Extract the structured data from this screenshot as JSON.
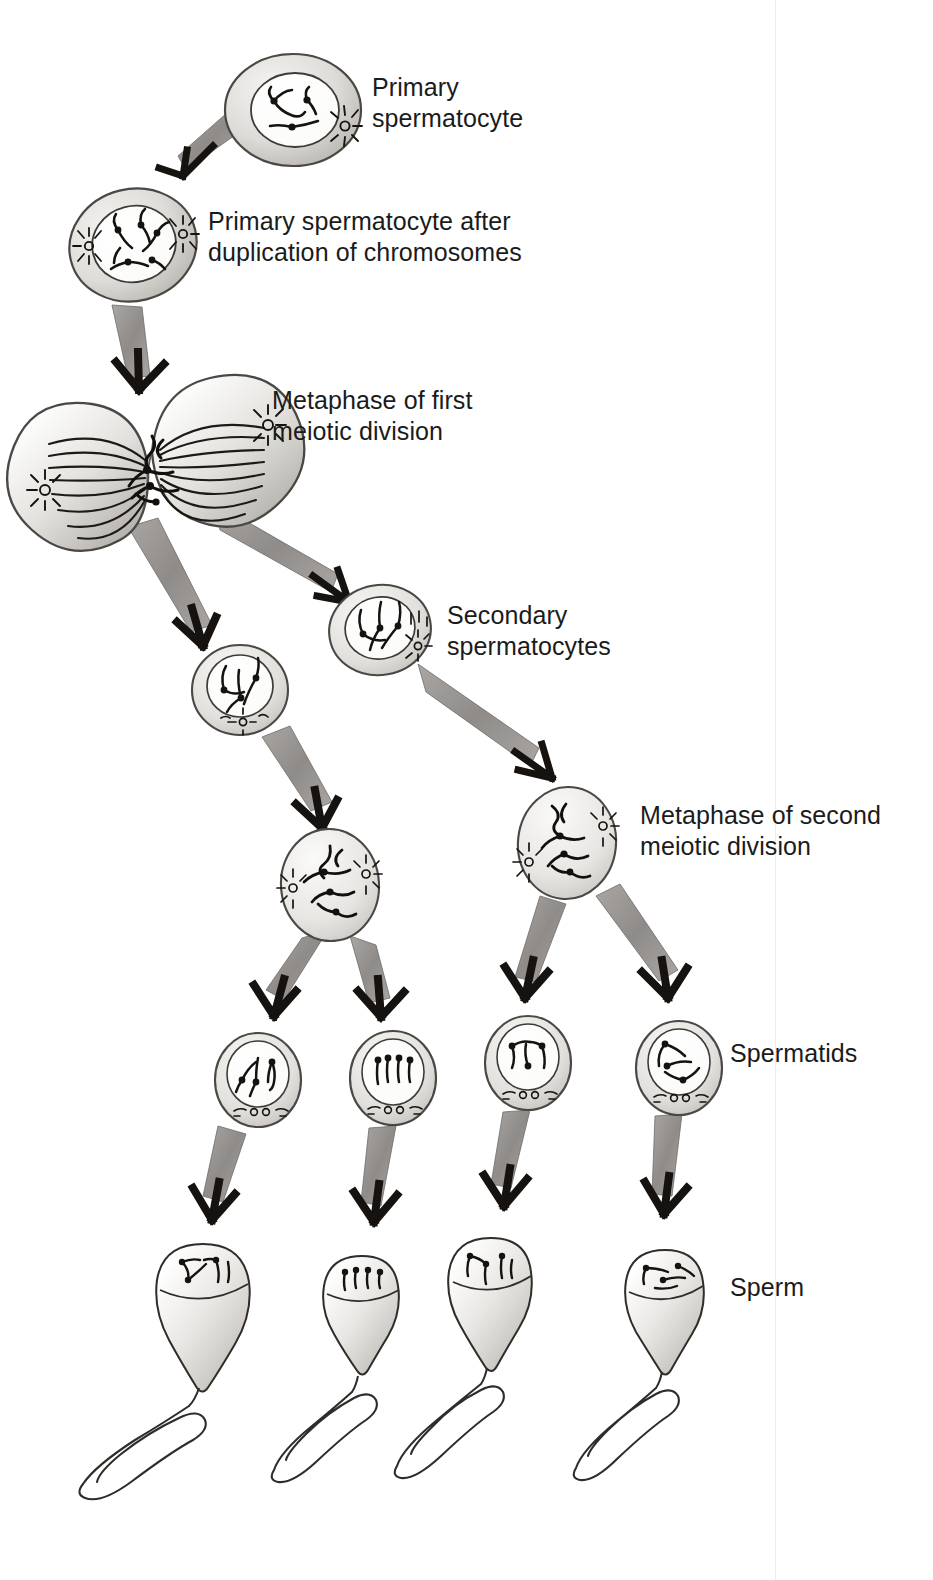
{
  "figure": {
    "background_color": "#ffffff",
    "ink_color": "#1b1b1b",
    "cell_fill_light": "#f2f1ef",
    "cell_fill_mid": "#d9d7d3",
    "cell_fill_dark": "#b3b0ab",
    "arrow_fill": "#9b9896"
  },
  "labels": [
    {
      "id": "primary-spermatocyte",
      "text": "Primary\nspermatocyte",
      "x": 372,
      "y": 72
    },
    {
      "id": "primary-spermatocyte-duplicated",
      "text": "Primary spermatocyte after\nduplication of chromosomes",
      "x": 208,
      "y": 206
    },
    {
      "id": "metaphase-first",
      "text": "Metaphase of first\nmeiotic division",
      "x": 272,
      "y": 385
    },
    {
      "id": "secondary-spermatocytes",
      "text": "Secondary\nspermatocytes",
      "x": 447,
      "y": 600
    },
    {
      "id": "metaphase-second",
      "text": "Metaphase of second\nmeiotic division",
      "x": 640,
      "y": 800
    },
    {
      "id": "spermatids",
      "text": "Spermatids",
      "x": 730,
      "y": 1038
    },
    {
      "id": "sperm",
      "text": "Sperm",
      "x": 730,
      "y": 1272
    }
  ],
  "stages": [
    {
      "id": "stage-primary-spermatocyte",
      "name": "Primary spermatocyte",
      "kind": "interphase-cell",
      "cx": 293,
      "cy": 110,
      "rx": 68,
      "ry": 56,
      "nucleus_rx": 43,
      "nucleus_ry": 36,
      "count": 1
    },
    {
      "id": "stage-primary-spermatocyte-duplicated",
      "name": "Primary spermatocyte after duplication of chromosomes",
      "kind": "interphase-cell",
      "cx": 133,
      "cy": 245,
      "rx": 63,
      "ry": 55,
      "nucleus_rx": 42,
      "nucleus_ry": 37,
      "count": 1
    },
    {
      "id": "stage-metaphase-first",
      "name": "Metaphase of first meiotic division",
      "kind": "dividing-cell",
      "cx": 150,
      "cy": 462,
      "count": 1
    },
    {
      "id": "stage-secondary-spermatocyte-right",
      "name": "Secondary spermatocyte",
      "kind": "interphase-cell",
      "cx": 380,
      "cy": 630,
      "rx": 50,
      "ry": 44,
      "nucleus_rx": 35,
      "nucleus_ry": 31,
      "count": 1
    },
    {
      "id": "stage-secondary-spermatocyte-left",
      "name": "Secondary spermatocyte",
      "kind": "interphase-cell",
      "cx": 240,
      "cy": 690,
      "rx": 47,
      "ry": 44,
      "nucleus_rx": 33,
      "nucleus_ry": 31,
      "count": 1
    },
    {
      "id": "stage-metaphase-second-left",
      "name": "Metaphase of second meiotic division",
      "kind": "metaphase-cell",
      "cx": 330,
      "cy": 885,
      "rx": 48,
      "ry": 55,
      "count": 1
    },
    {
      "id": "stage-metaphase-second-right",
      "name": "Metaphase of second meiotic division",
      "kind": "metaphase-cell",
      "cx": 567,
      "cy": 843,
      "rx": 48,
      "ry": 55,
      "count": 1
    },
    {
      "id": "stage-spermatid-1",
      "name": "Spermatid",
      "kind": "spermatid",
      "cx": 258,
      "cy": 1080,
      "rx": 42,
      "ry": 46,
      "count": 1
    },
    {
      "id": "stage-spermatid-2",
      "name": "Spermatid",
      "kind": "spermatid",
      "cx": 393,
      "cy": 1078,
      "rx": 42,
      "ry": 46,
      "count": 1
    },
    {
      "id": "stage-spermatid-3",
      "name": "Spermatid",
      "kind": "spermatid",
      "cx": 528,
      "cy": 1063,
      "rx": 42,
      "ry": 46,
      "count": 1
    },
    {
      "id": "stage-spermatid-4",
      "name": "Spermatid",
      "kind": "spermatid",
      "cx": 679,
      "cy": 1068,
      "rx": 42,
      "ry": 46,
      "count": 1
    },
    {
      "id": "stage-sperm-1",
      "name": "Sperm",
      "kind": "sperm",
      "cx": 203,
      "cy": 1290,
      "count": 1
    },
    {
      "id": "stage-sperm-2",
      "name": "Sperm",
      "kind": "sperm",
      "cx": 362,
      "cy": 1300,
      "count": 1
    },
    {
      "id": "stage-sperm-3",
      "name": "Sperm",
      "kind": "sperm",
      "cx": 491,
      "cy": 1282,
      "count": 1
    },
    {
      "id": "stage-sperm-4",
      "name": "Sperm",
      "kind": "sperm",
      "cx": 665,
      "cy": 1290,
      "count": 1
    }
  ],
  "arrows": [
    {
      "id": "arrow-1",
      "from": "stage-primary-spermatocyte",
      "to": "stage-primary-spermatocyte-duplicated"
    },
    {
      "id": "arrow-2",
      "from": "stage-primary-spermatocyte-duplicated",
      "to": "stage-metaphase-first"
    },
    {
      "id": "arrow-3",
      "from": "stage-metaphase-first",
      "to": "stage-secondary-spermatocyte-left"
    },
    {
      "id": "arrow-4",
      "from": "stage-metaphase-first",
      "to": "stage-secondary-spermatocyte-right"
    },
    {
      "id": "arrow-5",
      "from": "stage-secondary-spermatocyte-left",
      "to": "stage-metaphase-second-left"
    },
    {
      "id": "arrow-6",
      "from": "stage-secondary-spermatocyte-right",
      "to": "stage-metaphase-second-right"
    },
    {
      "id": "arrow-7",
      "from": "stage-metaphase-second-left",
      "to": "stage-spermatid-1"
    },
    {
      "id": "arrow-8",
      "from": "stage-metaphase-second-left",
      "to": "stage-spermatid-2"
    },
    {
      "id": "arrow-9",
      "from": "stage-metaphase-second-right",
      "to": "stage-spermatid-3"
    },
    {
      "id": "arrow-10",
      "from": "stage-metaphase-second-right",
      "to": "stage-spermatid-4"
    },
    {
      "id": "arrow-11",
      "from": "stage-spermatid-1",
      "to": "stage-sperm-1"
    },
    {
      "id": "arrow-12",
      "from": "stage-spermatid-2",
      "to": "stage-sperm-2"
    },
    {
      "id": "arrow-13",
      "from": "stage-spermatid-3",
      "to": "stage-sperm-3"
    },
    {
      "id": "arrow-14",
      "from": "stage-spermatid-4",
      "to": "stage-sperm-4"
    }
  ]
}
